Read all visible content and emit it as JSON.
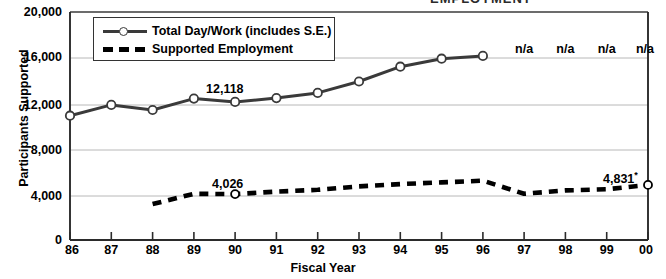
{
  "clipped_title": "EMPLOYMENT",
  "axes": {
    "ylabel": "Participants Supported",
    "xlabel": "Fiscal Year",
    "yticks": [
      "0",
      "4,000",
      "8,000",
      "12,000",
      "16,000",
      "20,000"
    ],
    "xticks": [
      "86",
      "87",
      "88",
      "89",
      "90",
      "91",
      "92",
      "93",
      "94",
      "95",
      "96",
      "97",
      "98",
      "99",
      "00"
    ]
  },
  "legend": {
    "items": [
      {
        "label": "Total Day/Work (includes S.E.)",
        "style": "solid-marker"
      },
      {
        "label": "Supported Employment",
        "style": "dashed"
      }
    ]
  },
  "annotations": {
    "total_1990": "12,118",
    "se_1990": "4,026",
    "se_2000": "4,831",
    "se_2000_superscript": "*",
    "na_labels": [
      "n/a",
      "n/a",
      "n/a",
      "n/a"
    ]
  },
  "chart_data": {
    "type": "line",
    "title": "",
    "xlabel": "Fiscal Year",
    "ylabel": "Participants Supported",
    "ylim": [
      0,
      20000
    ],
    "ytick_values": [
      0,
      4000,
      8000,
      12000,
      16000,
      20000
    ],
    "grid": true,
    "legend_position": "top-left-inside",
    "x": [
      "86",
      "87",
      "88",
      "89",
      "90",
      "91",
      "92",
      "93",
      "94",
      "95",
      "96",
      "97",
      "98",
      "99",
      "00"
    ],
    "series": [
      {
        "name": "Total Day/Work (includes S.E.)",
        "style": "solid",
        "marker": "open-circle",
        "values": [
          10900,
          11850,
          11400,
          12400,
          12118,
          12450,
          12900,
          13900,
          15200,
          15900,
          16150,
          null,
          null,
          null,
          null
        ],
        "labeled_points": [
          {
            "x": "90",
            "value": 12118,
            "label": "12,118"
          }
        ],
        "missing_labels": [
          {
            "x": "97",
            "label": "n/a"
          },
          {
            "x": "98",
            "label": "n/a"
          },
          {
            "x": "99",
            "label": "n/a"
          },
          {
            "x": "00",
            "label": "n/a"
          }
        ]
      },
      {
        "name": "Supported Employment",
        "style": "dashed",
        "marker": "open-circle",
        "values": [
          null,
          null,
          3150,
          4050,
          4026,
          4250,
          4400,
          4700,
          4900,
          5050,
          5200,
          4050,
          4350,
          4450,
          4831
        ],
        "labeled_points": [
          {
            "x": "90",
            "value": 4026,
            "label": "4,026"
          },
          {
            "x": "00",
            "value": 4831,
            "label": "4,831*"
          }
        ]
      }
    ]
  },
  "colors": {
    "line": "#3a3a3a",
    "dash": "#000000",
    "grid": "#b8b8b8",
    "axis": "#2b2b2b",
    "background": "#ffffff"
  }
}
